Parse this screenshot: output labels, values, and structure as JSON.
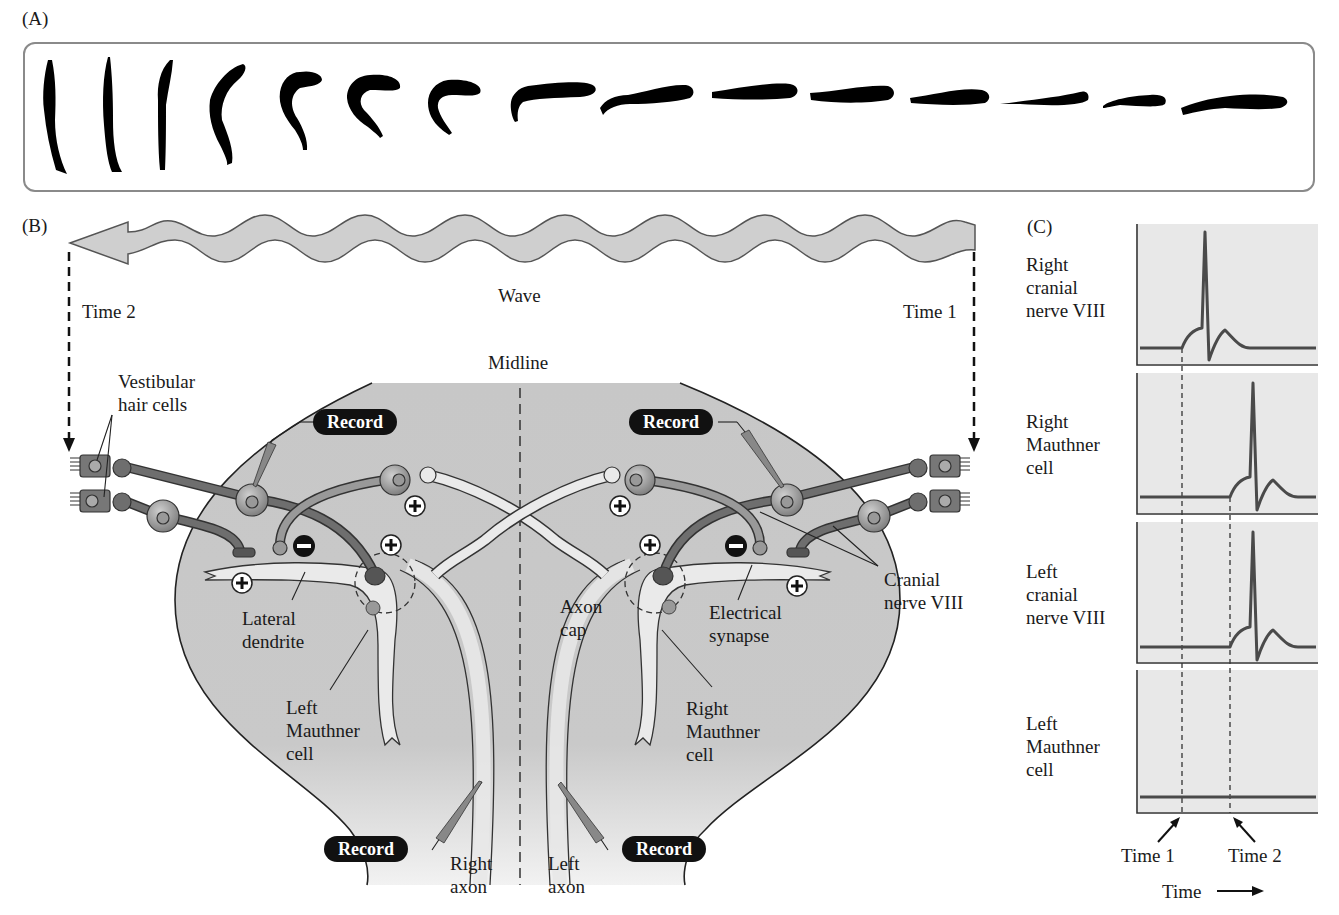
{
  "panels": {
    "a": {
      "letter": "(A)",
      "silhouette_count": 15
    },
    "b": {
      "letter": "(B)",
      "wave_label": "Wave",
      "time2_label": "Time 2",
      "time1_label": "Time 1",
      "midline_label": "Midline",
      "labels": {
        "vestibular": "Vestibular\nhair cells",
        "lateral_dendrite": "Lateral\ndendrite",
        "left_mauthner": "Left\nMauthner\ncell",
        "axon_cap": "Axon\ncap",
        "electrical_synapse": "Electrical\nsynapse",
        "right_mauthner": "Right\nMauthner\ncell",
        "cranial_nerve": "Cranial\nnerve VIII",
        "right_axon": "Right\naxon",
        "left_axon": "Left\naxon"
      },
      "record_buttons": [
        "Record",
        "Record",
        "Record",
        "Record"
      ],
      "synapse_signs": {
        "plus": "+",
        "minus": "−"
      }
    },
    "c": {
      "letter": "(C)",
      "traces": [
        {
          "label": "Right\ncranial\nnerve VIII",
          "spike_at": "time1"
        },
        {
          "label": "Right\nMauthner\ncell",
          "spike_at": "time2"
        },
        {
          "label": "Left\ncranial\nnerve VIII",
          "spike_at": "time2"
        },
        {
          "label": "Left\nMauthner\ncell",
          "spike_at": "none"
        }
      ],
      "time1_label": "Time 1",
      "time2_label": "Time 2",
      "axis_label": "Time"
    }
  },
  "colors": {
    "brain_fill": "#c9c9c9",
    "neuron_dark": "#6e6e6e",
    "neuron_light": "#e6e6e6",
    "trace_bg": "#e8e8e8",
    "trace_line": "#4a4a4a"
  }
}
